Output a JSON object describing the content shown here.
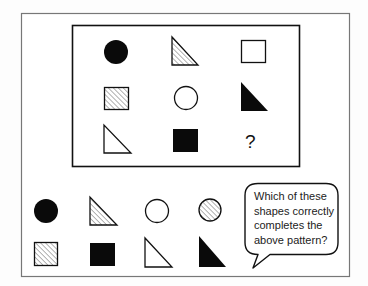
{
  "puzzle": {
    "grid": [
      [
        {
          "shape": "circle",
          "fill": "black"
        },
        {
          "shape": "triangle",
          "fill": "hatched"
        },
        {
          "shape": "square",
          "fill": "white"
        }
      ],
      [
        {
          "shape": "square",
          "fill": "hatched"
        },
        {
          "shape": "circle",
          "fill": "white"
        },
        {
          "shape": "triangle",
          "fill": "black"
        }
      ],
      [
        {
          "shape": "triangle",
          "fill": "white"
        },
        {
          "shape": "square",
          "fill": "black"
        },
        {
          "shape": "unknown",
          "label": "?"
        }
      ]
    ],
    "missing_label": "?"
  },
  "options": {
    "row1": [
      {
        "shape": "circle",
        "fill": "black"
      },
      {
        "shape": "triangle",
        "fill": "hatched"
      },
      {
        "shape": "circle",
        "fill": "white"
      },
      {
        "shape": "circle",
        "fill": "hatched"
      }
    ],
    "row2": [
      {
        "shape": "square",
        "fill": "hatched"
      },
      {
        "shape": "square",
        "fill": "black"
      },
      {
        "shape": "triangle",
        "fill": "white"
      },
      {
        "shape": "triangle",
        "fill": "black"
      }
    ]
  },
  "bubble": {
    "text": "Which of these shapes correctly completes the above pattern?"
  },
  "colors": {
    "stroke": "#111111",
    "frame": "#777777",
    "hatch": "#888888",
    "background": "#fdfdfd"
  }
}
